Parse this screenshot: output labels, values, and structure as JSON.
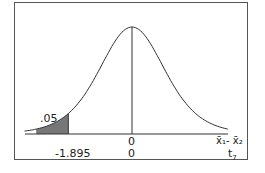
{
  "chart_data": {
    "type": "area",
    "title": "",
    "curve": "t-distribution",
    "df": 7,
    "center": 0,
    "shaded_region": {
      "tail": "left",
      "area": 0.05,
      "boundary": -1.895
    },
    "annotations": {
      "area_label": ".05",
      "critical_value_label": "-1.895",
      "center_label_top": "0",
      "center_label_bottom": "0"
    },
    "axis_labels": {
      "top": "x̄₁- x̄₂",
      "bottom": "t₇"
    },
    "grid": false,
    "legend": null
  },
  "labels": {
    "area": ".05",
    "critical": "-1.895",
    "zero_top": "0",
    "zero_bottom": "0",
    "axis_top": "x̄₁- x̄₂",
    "axis_bottom_base": "t",
    "axis_bottom_sub": "7"
  }
}
